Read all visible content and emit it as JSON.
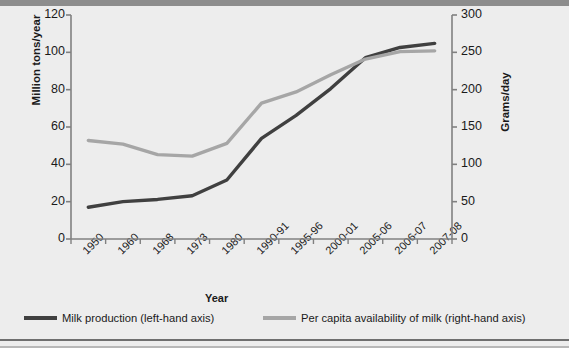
{
  "chart_data": {
    "type": "line",
    "title": "",
    "xlabel": "Year",
    "ylabel": "Million tons/year",
    "ylabel_right": "Grams/day",
    "categories": [
      "1950",
      "1960",
      "1968",
      "1973",
      "1980",
      "1990-91",
      "1995-96",
      "2000-01",
      "2005-06",
      "2006-07",
      "2007-08"
    ],
    "ylim": [
      0,
      120
    ],
    "yticks": [
      0,
      20,
      40,
      60,
      80,
      100,
      120
    ],
    "ylim_right": [
      0,
      300
    ],
    "yticks_right": [
      0,
      50,
      100,
      150,
      200,
      250,
      300
    ],
    "grid": false,
    "legend_position": "bottom",
    "series": [
      {
        "name": "Milk production (left-hand axis)",
        "axis": "left",
        "color": "#404040",
        "values": [
          17,
          20,
          21.2,
          23.2,
          31.6,
          53.9,
          66.2,
          80.6,
          97.1,
          102.6,
          104.8
        ]
      },
      {
        "name": "Per capita availability of milk (right-hand axis)",
        "axis": "right",
        "color": "#a6a6a6",
        "values": [
          132,
          127,
          113,
          111,
          128,
          182,
          197,
          220,
          241,
          251,
          252
        ]
      }
    ]
  },
  "axes": {
    "left_title": "Million tons/year",
    "right_title": "Grams/day",
    "x_title": "Year"
  },
  "legend": {
    "items": [
      {
        "label": "Milk production (left-hand axis)"
      },
      {
        "label": "Per capita availability of milk (right-hand axis)"
      }
    ]
  },
  "colors": {
    "series_dark": "#404040",
    "series_gray": "#a6a6a6",
    "background": "#ededed",
    "axis": "#808080"
  }
}
